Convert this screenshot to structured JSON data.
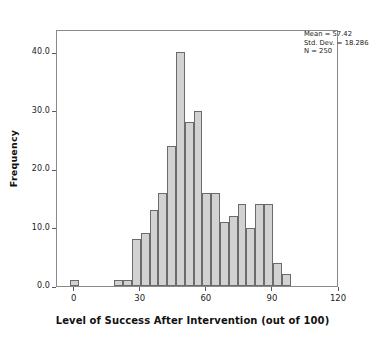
{
  "chart_data": {
    "type": "bar",
    "title": "",
    "subtitle": "",
    "xlabel": "Level of Success After Intervention (out of 100)",
    "ylabel": "Frequency",
    "xlim": [
      -8,
      120
    ],
    "ylim": [
      0,
      44
    ],
    "grid": false,
    "legend": null,
    "xticks": [
      0,
      30,
      60,
      90,
      120
    ],
    "xtick_labels": [
      "0",
      "30",
      "60",
      "90",
      "120"
    ],
    "yticks": [
      0,
      10,
      20,
      30,
      40
    ],
    "ytick_labels": [
      "0.0",
      "10.0",
      "20.0",
      "30.0",
      "40.0"
    ],
    "bin_width": 4,
    "bins": [
      {
        "left": -2,
        "right": 2,
        "center": 0,
        "value": 1
      },
      {
        "left": 18,
        "right": 22,
        "center": 20,
        "value": 1
      },
      {
        "left": 22,
        "right": 26,
        "center": 24,
        "value": 1
      },
      {
        "left": 26,
        "right": 30,
        "center": 28,
        "value": 8
      },
      {
        "left": 30,
        "right": 34,
        "center": 32,
        "value": 9
      },
      {
        "left": 34,
        "right": 38,
        "center": 36,
        "value": 13
      },
      {
        "left": 38,
        "right": 42,
        "center": 40,
        "value": 16
      },
      {
        "left": 42,
        "right": 46,
        "center": 44,
        "value": 24
      },
      {
        "left": 46,
        "right": 50,
        "center": 48,
        "value": 40
      },
      {
        "left": 50,
        "right": 54,
        "center": 52,
        "value": 28
      },
      {
        "left": 54,
        "right": 58,
        "center": 56,
        "value": 30
      },
      {
        "left": 58,
        "right": 62,
        "center": 60,
        "value": 16
      },
      {
        "left": 62,
        "right": 66,
        "center": 64,
        "value": 16
      },
      {
        "left": 66,
        "right": 70,
        "center": 68,
        "value": 11
      },
      {
        "left": 70,
        "right": 74,
        "center": 72,
        "value": 12
      },
      {
        "left": 74,
        "right": 78,
        "center": 76,
        "value": 14
      },
      {
        "left": 78,
        "right": 82,
        "center": 80,
        "value": 10
      },
      {
        "left": 82,
        "right": 86,
        "center": 84,
        "value": 14
      },
      {
        "left": 86,
        "right": 90,
        "center": 88,
        "value": 14
      },
      {
        "left": 90,
        "right": 94,
        "center": 92,
        "value": 4
      },
      {
        "left": 94,
        "right": 98,
        "center": 96,
        "value": 2
      }
    ]
  },
  "annotation": {
    "mean_label": "Mean = 57.42",
    "std_label": "Std. Dev. = 18.286",
    "n_label": "N = 250"
  },
  "style": {
    "bar_fill": "#d2d2d2",
    "bar_border": "#6b6b6b",
    "frame_color": "#8a8a8a",
    "background": "#ffffff",
    "text_color": "#1a1a1a"
  }
}
